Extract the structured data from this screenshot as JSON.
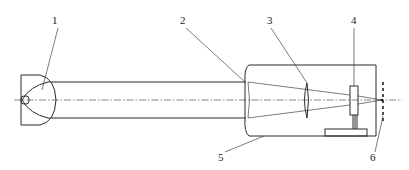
{
  "diagram": {
    "type": "optical-schematic",
    "labels": [
      {
        "id": "1",
        "text": "1",
        "x": 55,
        "y": 25,
        "target": "light-source-reflector"
      },
      {
        "id": "2",
        "text": "2",
        "x": 180,
        "y": 25,
        "target": "collimating-lens"
      },
      {
        "id": "3",
        "text": "3",
        "x": 268,
        "y": 25,
        "target": "focusing-lens"
      },
      {
        "id": "4",
        "text": "4",
        "x": 351,
        "y": 25,
        "target": "sample-holder"
      },
      {
        "id": "5",
        "text": "5",
        "x": 218,
        "y": 160,
        "target": "housing"
      },
      {
        "id": "6",
        "text": "6",
        "x": 370,
        "y": 160,
        "target": "focal-plane"
      }
    ],
    "colors": {
      "line": "#2a2a2a",
      "background": "#ffffff"
    }
  }
}
